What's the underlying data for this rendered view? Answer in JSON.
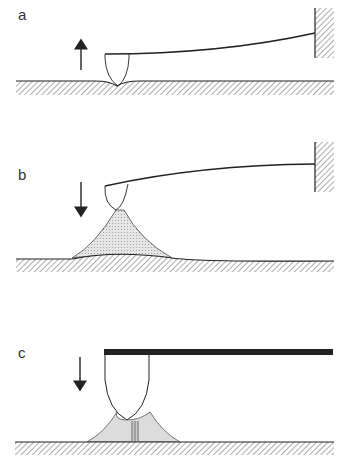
{
  "panels": [
    {
      "label": "a",
      "arrow": "up",
      "description": "tip retracting from surface, surface deformed by tip contact"
    },
    {
      "label": "b",
      "arrow": "down",
      "description": "tip approaching, liquid meniscus bridge forms between tip and surface"
    },
    {
      "label": "c",
      "arrow": "down",
      "description": "tip in contact with rigid cantilever, meniscus with capillary neck"
    }
  ],
  "colors": {
    "line": "#222222",
    "hatch": "#888888",
    "meniscus_fill": "#d9d9d9",
    "background": "#ffffff"
  }
}
